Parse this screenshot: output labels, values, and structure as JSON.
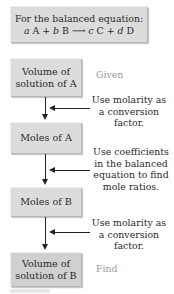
{
  "equation_box": {
    "line1": "For the balanced equation:",
    "line2_parts": [
      "a",
      " A + ",
      "b",
      " B ",
      "⟶",
      " ",
      "c",
      " C + ",
      "d",
      " D"
    ]
  },
  "flow": [
    {
      "label_line1": "Volume of",
      "label_line2": "solution of A",
      "tag": "Given"
    },
    {
      "label_line1": "Moles of A"
    },
    {
      "label_line1": "Moles of B"
    },
    {
      "label_line1": "Volume of",
      "label_line2": "solution of B",
      "tag": "Find"
    }
  ],
  "steps": [
    {
      "line1": "Use molarity as",
      "line2": "a conversion",
      "line3": "factor."
    },
    {
      "line1": "Use coefficients",
      "line2": "in the balanced",
      "line3": "equation to find",
      "line4": "mole ratios."
    },
    {
      "line1": "Use molarity as",
      "line2": "a conversion",
      "line3": "factor."
    }
  ],
  "colors": {
    "box_fill": "#dcdcdc",
    "arrow": "#222222",
    "tag_text": "#9a9a9a"
  }
}
